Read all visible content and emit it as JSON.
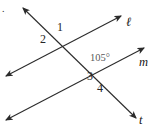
{
  "figure": {
    "type": "geometry-diagram",
    "background_color": "#ffffff",
    "stroke_color": "#2b2b2b",
    "width": 155,
    "height": 129
  },
  "corner_marker": {
    "text": "."
  },
  "lines": [
    {
      "id": "line-l",
      "label": "ℓ",
      "label_x": 126,
      "label_y": 16,
      "arrow_start": true,
      "arrow_end": true,
      "x1": 6,
      "y1": 76,
      "x2": 121,
      "y2": 16
    },
    {
      "id": "line-m",
      "label": "m",
      "label_x": 139,
      "label_y": 56,
      "arrow_start": true,
      "arrow_end": true,
      "x1": 6,
      "y1": 120,
      "x2": 144,
      "y2": 48
    },
    {
      "id": "line-t",
      "label": "t",
      "label_x": 139,
      "label_y": 114,
      "arrow_start": true,
      "arrow_end": true,
      "x1": 23,
      "y1": 8,
      "x2": 136,
      "y2": 118
    },
    {
      "id": "line-s",
      "label": "",
      "label_x": 0,
      "label_y": 0,
      "arrow_start": true,
      "arrow_end": true,
      "x1": 5,
      "y1": 122,
      "x2": 143,
      "y2": 49
    }
  ],
  "intersections": [
    {
      "id": "upper-vertex",
      "x": 62,
      "y": 40
    },
    {
      "id": "lower-vertex",
      "x": 108,
      "y": 77
    }
  ],
  "angle_labels": [
    {
      "id": "angle-1",
      "text": "1",
      "x": 57,
      "y": 21
    },
    {
      "id": "angle-2",
      "text": "2",
      "x": 40,
      "y": 33
    },
    {
      "id": "angle-3",
      "text": "3",
      "x": 87,
      "y": 70
    },
    {
      "id": "angle-4",
      "text": "4",
      "x": 97,
      "y": 82
    }
  ],
  "angle_measures": [
    {
      "id": "angle-105",
      "text": "105°",
      "x": 90,
      "y": 53
    }
  ]
}
